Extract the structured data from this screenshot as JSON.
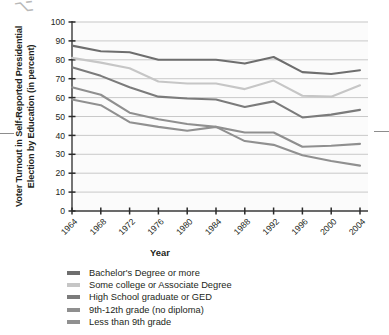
{
  "chart_data": {
    "type": "line",
    "title": "",
    "xlabel": "Year",
    "ylabel": "Voter Turnout in Self-Reported Presidential Election by Education (in percent)",
    "x": [
      1964,
      1968,
      1972,
      1976,
      1980,
      1984,
      1988,
      1992,
      1996,
      2000,
      2004
    ],
    "xtick_labels": [
      "1964",
      "1968",
      "1972",
      "1976",
      "1980",
      "1984",
      "1988",
      "1992",
      "1996",
      "2000",
      "2004"
    ],
    "ytick_labels": [
      "0",
      "10",
      "20",
      "30",
      "40",
      "50",
      "60",
      "70",
      "80",
      "90",
      "100"
    ],
    "yticks": [
      0,
      10,
      20,
      30,
      40,
      50,
      60,
      70,
      80,
      90,
      100
    ],
    "ylim": [
      0,
      100
    ],
    "xlim": [
      1964,
      2004
    ],
    "grid": "horizontal",
    "legend_position": "below",
    "series": [
      {
        "name": "Bachelor's Degree or more",
        "color": "#6e6e6e",
        "values": [
          87.5,
          84.5,
          84.0,
          80.0,
          80.0,
          80.0,
          78.0,
          81.5,
          73.5,
          72.5,
          74.5
        ]
      },
      {
        "name": "Some college or Associate Degree",
        "color": "#c6c6c6",
        "values": [
          81.0,
          78.5,
          75.5,
          68.5,
          67.5,
          67.5,
          64.5,
          69.0,
          61.0,
          60.5,
          66.5
        ]
      },
      {
        "name": "High School graduate or GED",
        "color": "#7b7b7b",
        "values": [
          76.0,
          71.5,
          65.5,
          60.5,
          59.5,
          59.0,
          55.0,
          58.0,
          49.5,
          51.0,
          53.5
        ]
      },
      {
        "name": "9th-12th grade (no diploma)",
        "color": "#8f8f8f",
        "values": [
          65.5,
          61.5,
          52.0,
          48.5,
          46.0,
          44.5,
          41.5,
          41.5,
          34.0,
          34.5,
          35.5
        ]
      },
      {
        "name": "Less than 9th grade",
        "color": "#909090",
        "values": [
          59.0,
          56.0,
          47.0,
          44.5,
          42.5,
          44.5,
          37.0,
          35.0,
          29.5,
          26.5,
          24.0
        ]
      }
    ]
  },
  "axis": {
    "y_title": "Voter Turnout in Self-Reported Presidential Election by Education (in percent)",
    "x_title": "Year"
  },
  "artifacts": {
    "top_mark": "⌥"
  }
}
